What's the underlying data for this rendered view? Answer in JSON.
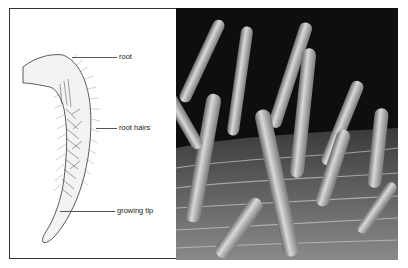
{
  "figure": {
    "drawing": {
      "labels": {
        "root": "root",
        "root_hairs": "root hairs",
        "growing_tip": "growing tip"
      }
    },
    "photo": {
      "description": "micrograph of root hairs"
    }
  }
}
